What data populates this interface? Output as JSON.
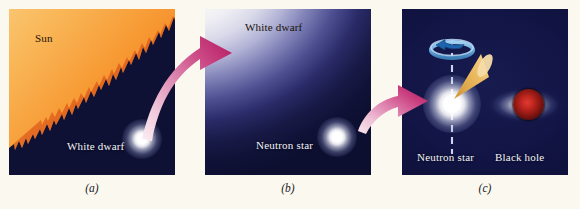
{
  "figure": {
    "background_color": "#fbf8ef",
    "width": 580,
    "height": 209
  },
  "panels": [
    {
      "id": "a",
      "caption": "(a)",
      "background_color": "#0e1134",
      "labels": [
        {
          "text": "Sun",
          "style": "dark"
        },
        {
          "text": "White dwarf",
          "style": "light"
        }
      ],
      "objects": [
        "sun-disk",
        "white-dwarf-star"
      ],
      "sun_gradient": [
        "#fbe2a4",
        "#f9b85a",
        "#f2801f",
        "#c03208"
      ]
    },
    {
      "id": "b",
      "caption": "(b)",
      "background_color": "#0d0f31",
      "labels": [
        {
          "text": "White dwarf",
          "style": "dark"
        },
        {
          "text": "Neutron star",
          "style": "light"
        }
      ],
      "objects": [
        "white-dwarf-disk",
        "neutron-star"
      ],
      "gradient": [
        "#fdfcf7",
        "#b3b4d6",
        "#4e5092",
        "#0d0f31"
      ]
    },
    {
      "id": "c",
      "caption": "(c)",
      "background_color": "#121545",
      "labels": [
        {
          "text": "Neutron star",
          "style": "light"
        },
        {
          "text": "Black hole",
          "style": "light"
        }
      ],
      "objects": [
        "neutron-star",
        "rotation-axis",
        "rotation-ring-arrow",
        "radiation-beam-cone",
        "black-hole-core",
        "accretion-disk"
      ],
      "accent_colors": {
        "rotation_ring": "#5b9fd4",
        "rotation_arrow": "#1a5fa8",
        "beam_cone": "#e8b45c",
        "black_hole_core": "#c52a22",
        "axis_line": "#cfd6f2"
      }
    }
  ],
  "arrows": [
    {
      "name": "arrow-a-to-b",
      "from_panel": "a",
      "to_panel": "b",
      "color_start": "#f7e2ec",
      "color_end": "#b81c62"
    },
    {
      "name": "arrow-b-to-c",
      "from_panel": "b",
      "to_panel": "c",
      "color_start": "#f3dce8",
      "color_end": "#bb1e63"
    }
  ]
}
